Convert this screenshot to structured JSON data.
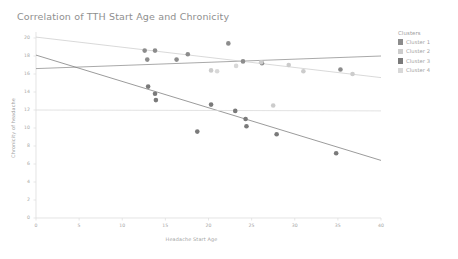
{
  "chart_data": {
    "type": "scatter",
    "title": "Correlation of TTH Start Age and Chronicity",
    "xlabel": "Headache Start Age",
    "ylabel": "Chronicity of headache",
    "xlim": [
      0,
      40
    ],
    "ylim": [
      0,
      20
    ],
    "xticks": [
      0,
      5,
      10,
      15,
      20,
      25,
      30,
      35,
      40
    ],
    "yticks": [
      0,
      2,
      4,
      6,
      8,
      10,
      12,
      14,
      16,
      18,
      20
    ],
    "grid": false,
    "legend_position": "right",
    "legend_title": "Clusters",
    "series": [
      {
        "name": "Cluster 1",
        "color": "#8c8c8c",
        "points": [
          {
            "x": 12.6,
            "y": 18.6
          },
          {
            "x": 13.8,
            "y": 18.6
          },
          {
            "x": 12.9,
            "y": 17.6
          },
          {
            "x": 16.3,
            "y": 17.6
          },
          {
            "x": 17.6,
            "y": 18.2
          },
          {
            "x": 22.3,
            "y": 19.4
          },
          {
            "x": 24.0,
            "y": 17.4
          },
          {
            "x": 26.2,
            "y": 17.2
          },
          {
            "x": 35.3,
            "y": 16.5
          }
        ],
        "trend": {
          "x0": 0,
          "y0": 16.6,
          "x1": 40,
          "y1": 18.0
        }
      },
      {
        "name": "Cluster 2",
        "color": "#cccccc",
        "points": [
          {
            "x": 20.3,
            "y": 16.4
          },
          {
            "x": 26.1,
            "y": 17.3
          },
          {
            "x": 29.3,
            "y": 17.0
          },
          {
            "x": 31.0,
            "y": 16.3
          },
          {
            "x": 36.7,
            "y": 16.0
          },
          {
            "x": 27.5,
            "y": 12.5
          }
        ],
        "trend": {
          "x0": 0,
          "y0": 20.1,
          "x1": 40,
          "y1": 15.6
        }
      },
      {
        "name": "Cluster 3",
        "color": "#7a7a7a",
        "points": [
          {
            "x": 13.0,
            "y": 14.6
          },
          {
            "x": 13.8,
            "y": 13.8
          },
          {
            "x": 13.9,
            "y": 13.1
          },
          {
            "x": 18.7,
            "y": 9.6
          },
          {
            "x": 20.3,
            "y": 12.6
          },
          {
            "x": 23.1,
            "y": 11.9
          },
          {
            "x": 24.3,
            "y": 11.0
          },
          {
            "x": 24.4,
            "y": 10.2
          },
          {
            "x": 27.9,
            "y": 9.3
          },
          {
            "x": 34.8,
            "y": 7.2
          }
        ],
        "trend": {
          "x0": 0,
          "y0": 18.1,
          "x1": 40,
          "y1": 6.4
        }
      },
      {
        "name": "Cluster 4",
        "color": "#d8d8d8",
        "points": [
          {
            "x": 21.0,
            "y": 16.3
          },
          {
            "x": 23.2,
            "y": 16.9
          }
        ],
        "trend": {
          "x0": 0,
          "y0": 12.0,
          "x1": 40,
          "y1": 11.9
        }
      }
    ]
  },
  "legend": {
    "title": "Clusters",
    "items": [
      {
        "label": "Cluster 1",
        "color": "#8c8c8c"
      },
      {
        "label": "Cluster 2",
        "color": "#cccccc"
      },
      {
        "label": "Cluster 3",
        "color": "#7a7a7a"
      },
      {
        "label": "Cluster 4",
        "color": "#d8d8d8"
      }
    ]
  },
  "axes": {
    "x_tick_labels": [
      "0",
      "5",
      "10",
      "15",
      "20",
      "25",
      "30",
      "35",
      "40"
    ],
    "y_tick_labels": [
      "0",
      "2",
      "4",
      "6",
      "8",
      "10",
      "12",
      "14",
      "16",
      "18",
      "20"
    ]
  }
}
